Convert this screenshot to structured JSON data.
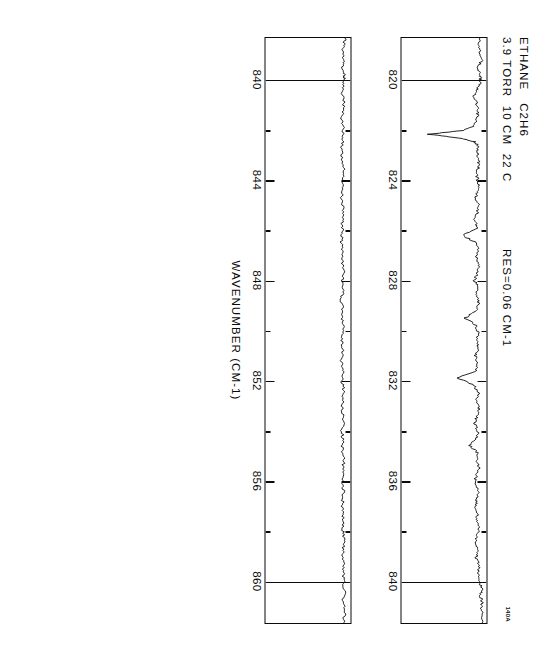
{
  "figure": {
    "scan_id": "140A",
    "annotations": {
      "line1": "ETHANE   C2H6",
      "line2": "3.9 TORR  10 CM  22 C",
      "resolution": "RES=0.06 CM-1"
    },
    "axis_title": "WAVENUMBER (CM-1)",
    "orientation_deg": 90,
    "ink_color": "#0b0b0b",
    "background_color": "#ffffff"
  },
  "chart_data": {
    "type": "line",
    "title": "ETHANE   C2H6",
    "subtitle": "3.9 TORR  10 CM  22 C   RES=0.06 CM-1",
    "xlabel": "WAVENUMBER (CM-1)",
    "ylabel": "",
    "grid": false,
    "legend": null,
    "panels": [
      {
        "name": "panel-top",
        "xlim": [
          818.3,
          841.7
        ],
        "ylim": [
          0,
          1
        ],
        "major_ticks": [
          820,
          824,
          828,
          832,
          836,
          840
        ],
        "minor_ticks": [
          822,
          826,
          830,
          834,
          838
        ],
        "tick_labels": [
          "820",
          "824",
          "828",
          "832",
          "836",
          "840"
        ],
        "gridlines": [
          820,
          840
        ],
        "series": [
          {
            "name": "transmittance",
            "x": [
              818.3,
              818.6,
              818.9,
              819.2,
              819.5,
              819.8,
              820.0,
              820.3,
              820.6,
              820.9,
              821.2,
              821.5,
              821.8,
              822.0,
              822.15,
              822.3,
              822.45,
              822.6,
              822.9,
              823.2,
              823.5,
              823.8,
              824.1,
              824.4,
              824.7,
              825.0,
              825.3,
              825.6,
              825.9,
              826.2,
              826.5,
              826.8,
              827.1,
              827.4,
              827.7,
              828.0,
              828.3,
              828.6,
              828.9,
              829.2,
              829.5,
              829.8,
              830.1,
              830.4,
              830.7,
              831.0,
              831.3,
              831.6,
              831.9,
              832.2,
              832.5,
              832.8,
              833.1,
              833.4,
              833.7,
              834.0,
              834.3,
              834.6,
              834.9,
              835.2,
              835.5,
              835.8,
              836.1,
              836.4,
              836.7,
              837.0,
              837.3,
              837.6,
              837.9,
              838.2,
              838.5,
              838.8,
              839.1,
              839.4,
              839.7,
              840.0,
              840.3,
              840.6,
              840.9,
              841.2,
              841.7
            ],
            "y": [
              0.93,
              0.9,
              0.93,
              0.94,
              0.9,
              0.92,
              0.93,
              0.9,
              0.85,
              0.88,
              0.9,
              0.89,
              0.86,
              0.72,
              0.32,
              0.68,
              0.86,
              0.9,
              0.89,
              0.91,
              0.9,
              0.88,
              0.91,
              0.9,
              0.87,
              0.91,
              0.89,
              0.86,
              0.9,
              0.72,
              0.88,
              0.9,
              0.88,
              0.91,
              0.89,
              0.86,
              0.9,
              0.88,
              0.91,
              0.89,
              0.75,
              0.88,
              0.9,
              0.88,
              0.9,
              0.87,
              0.9,
              0.88,
              0.66,
              0.86,
              0.9,
              0.88,
              0.91,
              0.89,
              0.86,
              0.9,
              0.88,
              0.8,
              0.9,
              0.88,
              0.91,
              0.88,
              0.86,
              0.9,
              0.89,
              0.87,
              0.9,
              0.88,
              0.91,
              0.89,
              0.87,
              0.9,
              0.88,
              0.91,
              0.9,
              0.92,
              0.94,
              0.93,
              0.95,
              0.94,
              0.95
            ]
          }
        ]
      },
      {
        "name": "panel-bottom",
        "xlim": [
          838.3,
          861.7
        ],
        "ylim": [
          0,
          1
        ],
        "major_ticks": [
          840,
          844,
          848,
          852,
          856,
          860
        ],
        "minor_ticks": [
          842,
          846,
          850,
          854,
          858
        ],
        "tick_labels": [
          "840",
          "844",
          "848",
          "852",
          "856",
          "860"
        ],
        "gridlines": [
          840,
          860
        ],
        "series": [
          {
            "name": "transmittance",
            "x": [
              838.3,
              838.6,
              838.9,
              839.2,
              839.5,
              839.8,
              840.0,
              840.4,
              840.8,
              841.2,
              841.6,
              842.0,
              842.4,
              842.8,
              843.2,
              843.6,
              844.0,
              844.4,
              844.8,
              845.2,
              845.6,
              846.0,
              846.4,
              846.8,
              847.2,
              847.6,
              848.0,
              848.4,
              848.8,
              849.2,
              849.6,
              850.0,
              850.4,
              850.8,
              851.2,
              851.6,
              852.0,
              852.4,
              852.8,
              853.2,
              853.6,
              854.0,
              854.4,
              854.8,
              855.2,
              855.6,
              856.0,
              856.4,
              856.8,
              857.2,
              857.6,
              858.0,
              858.4,
              858.8,
              859.2,
              859.6,
              860.0,
              860.4,
              860.8,
              861.2,
              861.7
            ],
            "y": [
              0.94,
              0.92,
              0.9,
              0.92,
              0.91,
              0.93,
              0.92,
              0.9,
              0.92,
              0.91,
              0.9,
              0.92,
              0.91,
              0.89,
              0.91,
              0.92,
              0.9,
              0.91,
              0.89,
              0.92,
              0.9,
              0.91,
              0.89,
              0.91,
              0.9,
              0.92,
              0.9,
              0.91,
              0.89,
              0.91,
              0.9,
              0.92,
              0.9,
              0.91,
              0.89,
              0.91,
              0.9,
              0.92,
              0.91,
              0.9,
              0.92,
              0.9,
              0.91,
              0.9,
              0.92,
              0.91,
              0.9,
              0.92,
              0.91,
              0.9,
              0.92,
              0.91,
              0.93,
              0.91,
              0.92,
              0.91,
              0.92,
              0.93,
              0.91,
              0.93,
              0.92
            ]
          }
        ]
      }
    ]
  }
}
